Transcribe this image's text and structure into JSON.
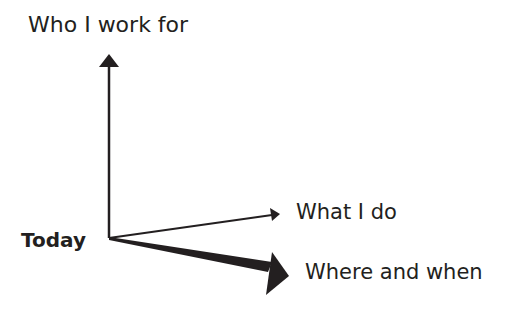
{
  "diagram": {
    "origin_label": "Today",
    "axes": [
      {
        "label": "Who I work for",
        "direction": "up",
        "weight": "medium"
      },
      {
        "label": "What I do",
        "direction": "right-up",
        "weight": "thin"
      },
      {
        "label": "Where and when",
        "direction": "right-down",
        "weight": "thick"
      }
    ],
    "colors": {
      "ink": "#231f20",
      "background": "#ffffff"
    }
  }
}
